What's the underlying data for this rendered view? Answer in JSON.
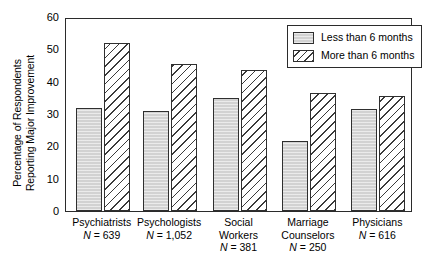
{
  "chart_data": {
    "type": "bar",
    "title": "",
    "xlabel": "",
    "ylabel": "Percentage of Respondents Reporting Major Improvement",
    "ylabel_lines": [
      "Percentage of Respondents",
      "Reporting Major Improvement"
    ],
    "ylim": [
      0,
      60
    ],
    "yticks": [
      0,
      10,
      20,
      30,
      40,
      50,
      60
    ],
    "ytick_labels": [
      "0",
      "10",
      "20",
      "30",
      "40",
      "50",
      "60"
    ],
    "grid": false,
    "legend_position": "top-right",
    "categories": [
      "Psychiatrists",
      "Psychologists",
      "Social Workers",
      "Marriage Counselors",
      "Physicians"
    ],
    "category_lines": [
      [
        "Psychiatrists"
      ],
      [
        "Psychologists"
      ],
      [
        "Social",
        "Workers"
      ],
      [
        "Marriage",
        "Counselors"
      ],
      [
        "Physicians"
      ]
    ],
    "category_n": [
      "N = 639",
      "N = 1,052",
      "N = 381",
      "N = 250",
      "N = 616"
    ],
    "series": [
      {
        "name": "Less than 6 months",
        "fill": "solid-gray",
        "values": [
          32,
          31,
          35,
          21.5,
          31.5
        ]
      },
      {
        "name": "More than 6 months",
        "fill": "diagonal-hatch",
        "values": [
          52,
          45.5,
          43.5,
          36.5,
          35.5
        ]
      }
    ],
    "colors": {
      "solid_fill": "#d2d2d2",
      "hatch_line": "#3a3a3a",
      "outline": "#2f2f2f",
      "axis": "#2b2b2b",
      "background": "#ffffff"
    }
  },
  "legend": {
    "items": [
      {
        "label": "Less than 6 months",
        "swatch": "solid"
      },
      {
        "label": "More than 6 months",
        "swatch": "hatch"
      }
    ]
  }
}
